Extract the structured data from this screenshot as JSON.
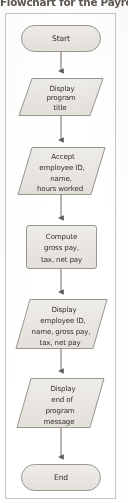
{
  "figure": {
    "caption": "Flowchart for the Payroll Pro",
    "frame_color": "#c8c4bd"
  },
  "style": {
    "shape_fill": "#e9e7e3",
    "shape_stroke": "#9a958e",
    "connector_color": "#6e6a65",
    "text_color": "#332e28",
    "page_background": "#fefefe"
  },
  "flowchart": {
    "type": "flowchart",
    "orientation": "top-to-bottom",
    "nodes": [
      {
        "id": "start",
        "shape": "terminator",
        "shape_label": "rounded-rectangle",
        "lines": [
          "Start"
        ],
        "text": "Start"
      },
      {
        "id": "display-title",
        "shape": "input-output",
        "shape_label": "parallelogram",
        "lines": [
          "Display",
          "program",
          "title"
        ],
        "text": "Display program title"
      },
      {
        "id": "accept-input",
        "shape": "input-output",
        "shape_label": "parallelogram",
        "lines": [
          "Accept",
          "employee ID,",
          "name,",
          "hours worked"
        ],
        "text": "Accept employee ID, name, hours worked"
      },
      {
        "id": "compute-pay",
        "shape": "process",
        "shape_label": "rectangle",
        "lines": [
          "Compute",
          "gross pay,",
          "tax, net pay"
        ],
        "text": "Compute gross pay, tax, net pay"
      },
      {
        "id": "display-results",
        "shape": "input-output",
        "shape_label": "parallelogram",
        "lines": [
          "Display",
          "employee ID,",
          "name, gross pay,",
          "tax, net pay"
        ],
        "text": "Display employee ID, name, gross pay, tax, net pay"
      },
      {
        "id": "display-end-message",
        "shape": "input-output",
        "shape_label": "parallelogram",
        "lines": [
          "Display",
          "end of",
          "program",
          "message"
        ],
        "text": "Display end of program message"
      },
      {
        "id": "end",
        "shape": "terminator",
        "shape_label": "rounded-rectangle",
        "lines": [
          "End"
        ],
        "text": "End"
      }
    ],
    "edges": [
      {
        "from": "start",
        "to": "display-title",
        "arrow": "down"
      },
      {
        "from": "display-title",
        "to": "accept-input",
        "arrow": "down"
      },
      {
        "from": "accept-input",
        "to": "compute-pay",
        "arrow": "down"
      },
      {
        "from": "compute-pay",
        "to": "display-results",
        "arrow": "down"
      },
      {
        "from": "display-results",
        "to": "display-end-message",
        "arrow": "down"
      },
      {
        "from": "display-end-message",
        "to": "end",
        "arrow": "down"
      }
    ]
  }
}
